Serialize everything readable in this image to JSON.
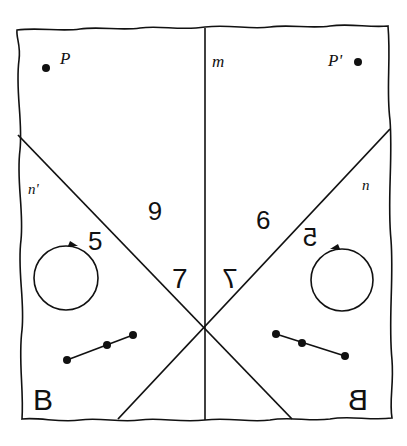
{
  "diagram": {
    "type": "reflection-symmetry",
    "colors": {
      "ink": "#111111",
      "paper": "#ffffff"
    },
    "labels": {
      "point_left": "P",
      "point_right": "P'",
      "mirror_line": "m",
      "line_left": "n'",
      "line_right": "n",
      "digit_five_left": "5",
      "digit_five_right": "5",
      "digit_six_left": "6",
      "digit_six_right": "6",
      "digit_seven_left": "7",
      "digit_seven_right": "7",
      "letter_left": "B",
      "letter_right": "B"
    }
  }
}
